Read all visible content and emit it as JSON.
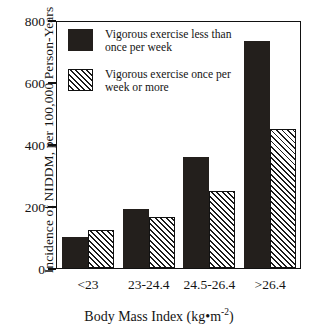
{
  "chart_data": {
    "type": "bar",
    "title": "",
    "xlabel": "Body Mass Index (kg•m-2)",
    "xlabel_base": "Body Mass Index (kg•m",
    "xlabel_exponent": "-2",
    "xlabel_close": ")",
    "ylabel": "Incidence of NIDDM, per 100,000 Person-Years",
    "categories": [
      "<23",
      "23-24.4",
      "24.5-26.4",
      ">26.4"
    ],
    "series": [
      {
        "name": "Vigorous exercise less than once per week",
        "name_line1": "Vigorous exercise less than",
        "name_line2": "once per week",
        "fill": "solid-black",
        "color": "#231f1c",
        "values": [
          100,
          190,
          358,
          735
        ]
      },
      {
        "name": "Vigorous exercise once per week or more",
        "name_line1": "Vigorous exercise once per",
        "name_line2": "week or more",
        "fill": "diagonal-hatch",
        "color": "#ffffff",
        "values": [
          123,
          165,
          248,
          450
        ]
      }
    ],
    "ylim": [
      0,
      800
    ],
    "yticks": [
      0,
      200,
      400,
      600,
      800
    ],
    "ytick_labels": [
      "0",
      "200",
      "400",
      "600",
      "800"
    ],
    "grid": false,
    "legend_position": "upper-left-inside"
  }
}
